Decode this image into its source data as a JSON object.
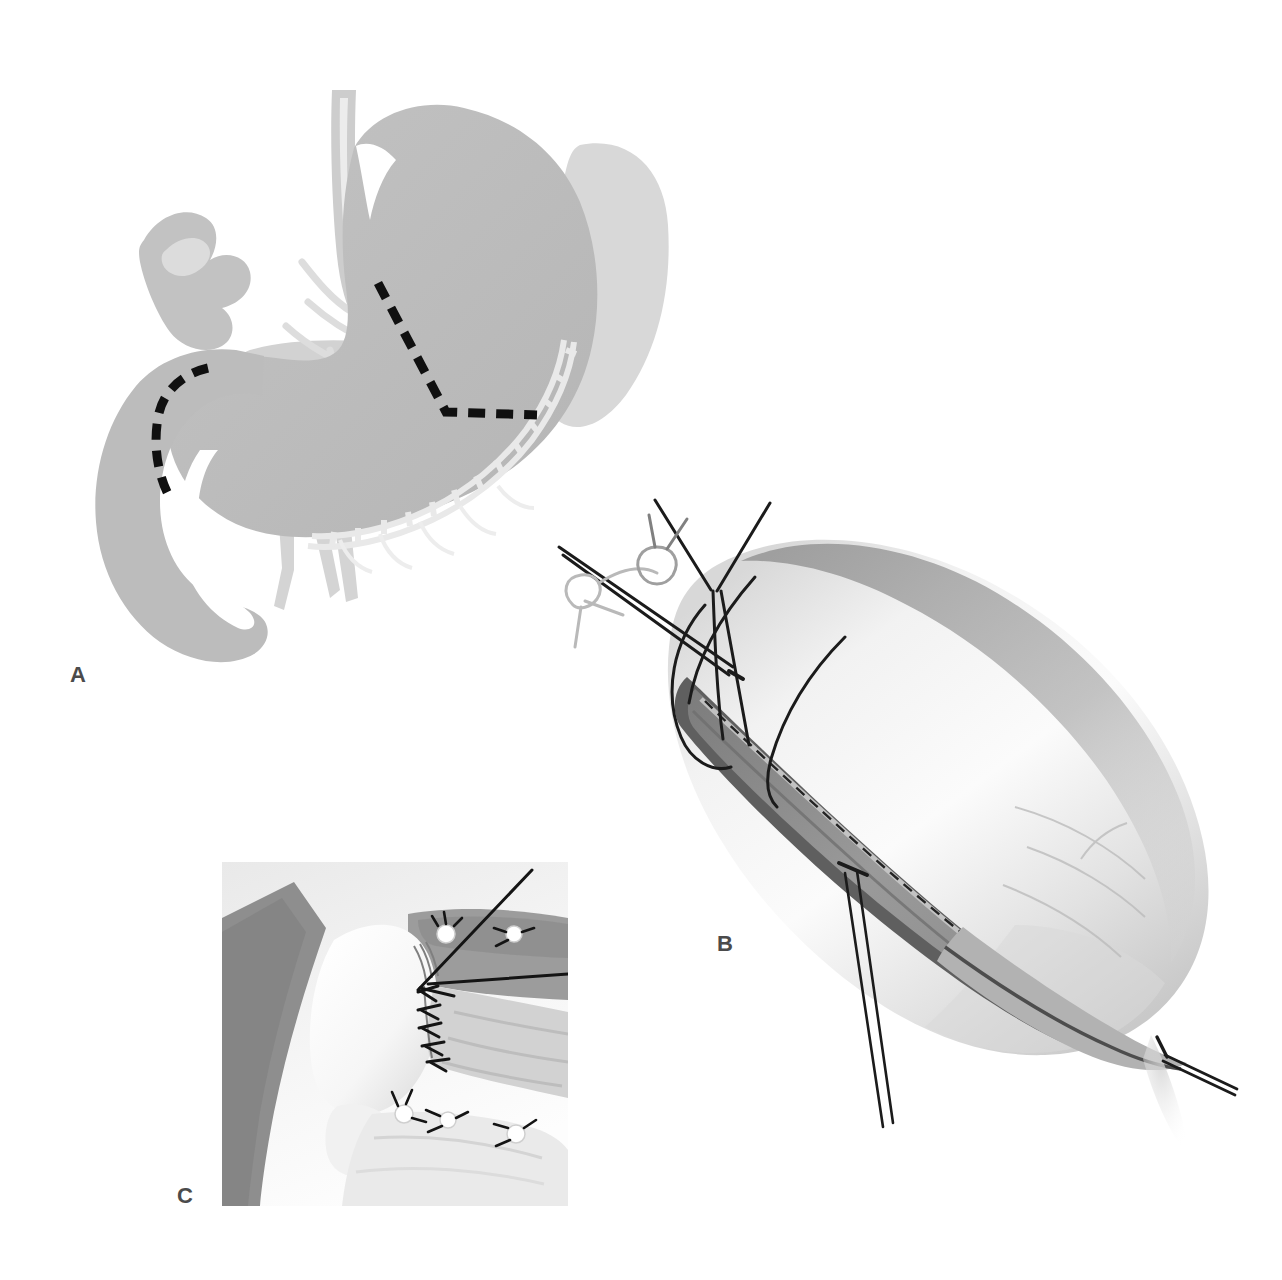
{
  "figure": {
    "type": "surgical-illustration",
    "background_color": "#ffffff",
    "width": 1282,
    "height": 1280,
    "panel_count": 3
  },
  "panels": [
    {
      "id": "a",
      "label": "A",
      "label_color": "#4b4b4b",
      "subject": "stomach-and-duodenum-anatomy-with-resection-lines",
      "description": "Schematic grey rendering of stomach, duodenum, spleen and gastric vasculature with black dashed lines marking the planned lines of resection",
      "bounds": {
        "x": 60,
        "y": 60,
        "width": 600,
        "height": 620
      },
      "structures": [
        {
          "name": "stomach-body",
          "fill": "#bdbdbd"
        },
        {
          "name": "duodenum",
          "fill": "#bdbdbd"
        },
        {
          "name": "spleen",
          "fill": "#d6d6d6"
        },
        {
          "name": "pancreas",
          "fill": "#cfcfcf"
        },
        {
          "name": "liver-segment",
          "fill": "#c4c4c4"
        },
        {
          "name": "gastroepiploic-vascular-arcade",
          "fill": "#ebebeb"
        },
        {
          "name": "celiac-and-aortic-vessels",
          "fill": "#dcdcdc"
        },
        {
          "name": "esophagus",
          "fill": "#cccccc"
        }
      ],
      "annotations": [
        {
          "name": "gastric-resection-dashed-line",
          "style": "dashed",
          "color": "#121212",
          "width": 9
        },
        {
          "name": "duodenal-resection-dashed-line",
          "style": "dashed",
          "color": "#121212",
          "width": 9
        }
      ]
    },
    {
      "id": "b",
      "label": "B",
      "label_color": "#4b4b4b",
      "subject": "gastric-remnant-with-longitudinal-gastrotomy",
      "description": "Large elongated gastric remnant viewed obliquely with a long longitudinal incision through the wall, stay sutures at both ends and a straight needle passing through the proximal corner",
      "bounds": {
        "x": 560,
        "y": 470,
        "width": 700,
        "height": 680
      },
      "structures": [
        {
          "name": "gastric-remnant-serosa",
          "fill": "#efefef"
        },
        {
          "name": "posterior-shadow",
          "fill": "#9e9e9e"
        },
        {
          "name": "incision-lumen",
          "fill": "#8a8a8a"
        },
        {
          "name": "mucosal-edge",
          "fill": "#bdbdbd"
        }
      ],
      "annotations": [
        {
          "name": "stay-suture-proximal",
          "color": "#1c1c1c"
        },
        {
          "name": "suture-knot-upper",
          "color": "#1c1c1c"
        },
        {
          "name": "straight-needle",
          "color": "#1c1c1c"
        },
        {
          "name": "curved-needle-holder",
          "color": "#1c1c1c"
        },
        {
          "name": "traction-suture-distal",
          "color": "#1c1c1c"
        },
        {
          "name": "dashed-staple-line",
          "style": "dashed",
          "color": "#2a2a2a"
        }
      ]
    },
    {
      "id": "c",
      "label": "C",
      "label_color": "#4b4b4b",
      "subject": "anastomosis-detail-inset",
      "description": "Close-up photographic-style inset of the completed anastomosis showing interrupted seromuscular sutures with white pledgets along the suture line and a long suture tail drawn to the upper right",
      "bounds": {
        "x": 222,
        "y": 862,
        "width": 346,
        "height": 344
      },
      "structures": [
        {
          "name": "inset-background",
          "fill": "#f4f4f4"
        },
        {
          "name": "retracted-tissue-flap",
          "fill": "#8c8c8c"
        },
        {
          "name": "bowel-loop",
          "fill": "#fafafa"
        },
        {
          "name": "serosal-surface",
          "fill": "#dedede"
        }
      ],
      "annotations": [
        {
          "name": "interrupted-suture-row",
          "color": "#161616"
        },
        {
          "name": "suture-pledget",
          "color": "#ffffff"
        },
        {
          "name": "suture-tail",
          "color": "#161616"
        }
      ]
    }
  ],
  "palette": {
    "paper_white": "#ffffff",
    "organ_mid_grey": "#bdbdbd",
    "organ_light_grey": "#d6d6d6",
    "shadow_grey": "#9e9e9e",
    "ink_black": "#121212",
    "label_grey": "#4b4b4b"
  }
}
